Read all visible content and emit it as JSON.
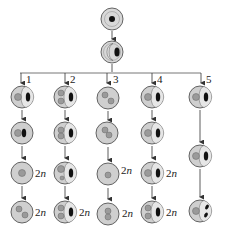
{
  "diagram": {
    "type": "cell-lineage-flow",
    "colors": {
      "cytoplasm": "#cfcfcf",
      "cytoplasm_light": "#e4e4e4",
      "outline": "#555555",
      "nucleus": "#9a9a9a",
      "dark_body": "#111111",
      "line": "#555555"
    },
    "root": {
      "cells": [
        {
          "id": "top-cell",
          "features": [
            "single-dark-nucleus",
            "double-ring"
          ]
        },
        {
          "id": "second-cell",
          "features": [
            "crescent-vacuole",
            "dark-body"
          ]
        }
      ]
    },
    "branches": [
      {
        "label": "1",
        "cells": [
          {
            "features": [
              "nucleus",
              "vacuole",
              "dark-body"
            ],
            "ploidy": ""
          },
          {
            "features": [
              "nucleus",
              "dark-body"
            ],
            "ploidy": ""
          },
          {
            "features": [
              "nucleus"
            ],
            "ploidy": "2n"
          },
          {
            "features": [
              "two-nuclei"
            ],
            "ploidy": "2n"
          }
        ]
      },
      {
        "label": "2",
        "cells": [
          {
            "features": [
              "two-nuclei",
              "vacuole",
              "dark-body"
            ],
            "ploidy": ""
          },
          {
            "features": [
              "two-nuclei-touching",
              "vacuole",
              "dark-body"
            ],
            "ploidy": ""
          },
          {
            "features": [
              "large-and-small-nucleus",
              "vacuole",
              "dark-body"
            ],
            "ploidy": ""
          },
          {
            "features": [
              "two-nuclei",
              "vacuole",
              "dark-body"
            ],
            "ploidy": "2n"
          }
        ]
      },
      {
        "label": "3",
        "cells": [
          {
            "features": [
              "two-nuclei-diagonal"
            ],
            "ploidy": ""
          },
          {
            "features": [
              "two-nuclei-touching"
            ],
            "ploidy": ""
          },
          {
            "features": [
              "nucleus"
            ],
            "ploidy": "2n"
          },
          {
            "features": [
              "two-nuclei-stacked"
            ],
            "ploidy": "2n"
          }
        ]
      },
      {
        "label": "4",
        "cells": [
          {
            "features": [
              "nucleus",
              "vacuole",
              "dark-body"
            ],
            "ploidy": ""
          },
          {
            "features": [
              "nucleus",
              "vacuole",
              "dark-body"
            ],
            "ploidy": ""
          },
          {
            "features": [
              "nucleus",
              "vacuole",
              "dark-body"
            ],
            "ploidy": "2n"
          },
          {
            "features": [
              "two-nuclei",
              "vacuole",
              "dark-body"
            ],
            "ploidy": "2n"
          }
        ]
      },
      {
        "label": "5",
        "cells": [
          {
            "features": [
              "nucleus",
              "vacuole",
              "dark-body"
            ],
            "ploidy": ""
          },
          {
            "features": [
              "nucleus",
              "vacuole",
              "dark-body"
            ],
            "ploidy": ""
          },
          {
            "features": [
              "nucleus",
              "vacuole",
              "split-dark-bodies"
            ],
            "ploidy": ""
          }
        ]
      }
    ],
    "ploidy_labels": {
      "c1r3": "2n",
      "c1r4": "2n",
      "c2r4": "2n",
      "c3r3": "2n",
      "c3r4": "2n",
      "c4r3": "2n",
      "c4r4": "2n"
    },
    "branch_labels": [
      "1",
      "2",
      "3",
      "4",
      "5"
    ]
  }
}
